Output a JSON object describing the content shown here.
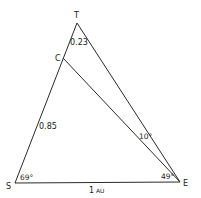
{
  "diagram": {
    "type": "triangle-geometry",
    "vertices": {
      "T": {
        "label": "T",
        "x": 77,
        "y": 23
      },
      "C": {
        "label": "C",
        "x": 63,
        "y": 58
      },
      "S": {
        "label": "S",
        "x": 15,
        "y": 183
      },
      "E": {
        "label": "E",
        "x": 180,
        "y": 182
      }
    },
    "segments": [
      {
        "from": "S",
        "to": "T"
      },
      {
        "from": "T",
        "to": "E"
      },
      {
        "from": "S",
        "to": "E"
      },
      {
        "from": "C",
        "to": "E"
      }
    ],
    "labels": {
      "tc_length": "0.23",
      "sc_length": "0.85",
      "se_length_num": "1",
      "se_length_unit": "AU",
      "angle_s": "69°",
      "angle_e": "49°",
      "angle_tec": "10°"
    },
    "colors": {
      "line": "#2a2a2a",
      "text": "#1a1a1a",
      "background": "#ffffff"
    }
  }
}
